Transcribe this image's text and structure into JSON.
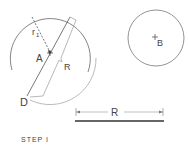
{
  "diagram": {
    "labels": {
      "r1": "r",
      "r1_sub": "1",
      "point_a": "A",
      "bracket_r": "R",
      "point_d": "D",
      "point_b": "B",
      "dimension_r": "R",
      "step": "STEP I"
    },
    "colors": {
      "line": "#555555",
      "light_line": "#aaaaaa",
      "text": "#444444"
    }
  }
}
